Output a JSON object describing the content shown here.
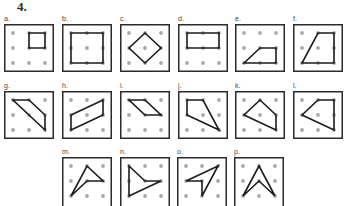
{
  "problem": {
    "number": "4."
  },
  "colors": {
    "frame": "#2b2b2b",
    "dot": "#a9a9a9",
    "shape": "#1c1c1c"
  },
  "grid": {
    "rows": 3,
    "cols": 3
  },
  "figures": [
    {
      "label": "a.",
      "points": "1,0 2,0 2,1 1,1"
    },
    {
      "label": "b.",
      "points": "0,0 2,0 2,2 0,2"
    },
    {
      "label": "c.",
      "points": "1,0 2,1 1,2 0,1"
    },
    {
      "label": "d.",
      "points": "0,0 2,0 2,1 0,1"
    },
    {
      "label": "e.",
      "points": "0,2 1,1 2,1 2,2"
    },
    {
      "label": "f.",
      "points": "1,0 2,0 2,2 0,2"
    },
    {
      "label": "g.",
      "points": "0,0 1,0 2,1 2,2"
    },
    {
      "label": "h.",
      "points": "0,1 2,0 2,1 0,2"
    },
    {
      "label": "i.",
      "points": "0,0 1,0 2,1 1,1"
    },
    {
      "label": "j.",
      "points": "0,0 1,0 2,2 0,1"
    },
    {
      "label": "k.",
      "points": "1,0 2,1 2,2 0,1"
    },
    {
      "label": "l.",
      "points": "1,0 2,0 2,2 0,1"
    },
    {
      "label": "m.",
      "points": "1,0 2,1 1,1 0,2"
    },
    {
      "label": "n.",
      "points": "0,0 1,1 2,1 0,2"
    },
    {
      "label": "o.",
      "points": "2,0 0,1 1,1 1,2"
    },
    {
      "label": "p.",
      "points": "1,0 2,2 1,1 0,2"
    }
  ]
}
